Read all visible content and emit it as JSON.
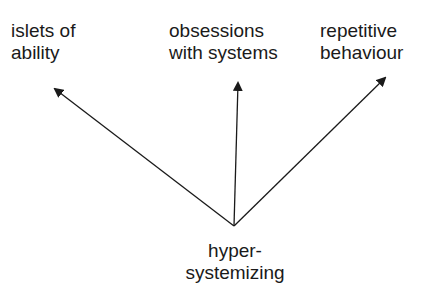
{
  "diagram": {
    "source": {
      "lines": [
        "hyper-",
        "systemizing"
      ]
    },
    "targets": [
      {
        "id": "islets",
        "lines": [
          "islets of",
          "ability"
        ]
      },
      {
        "id": "obsessions",
        "lines": [
          "obsessions",
          "with systems"
        ]
      },
      {
        "id": "repetitive",
        "lines": [
          "repetitive",
          "behaviour"
        ]
      }
    ],
    "edges": [
      {
        "from": "hyper-systemizing",
        "to": "islets of ability"
      },
      {
        "from": "hyper-systemizing",
        "to": "obsessions with systems"
      },
      {
        "from": "hyper-systemizing",
        "to": "repetitive behaviour"
      }
    ],
    "colors": {
      "line": "#1a1a1a",
      "background": "#ffffff"
    }
  }
}
